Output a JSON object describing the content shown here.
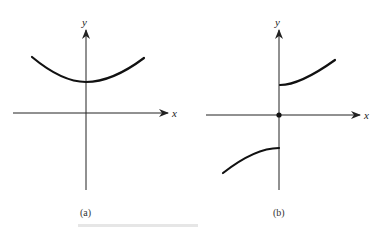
{
  "figure": {
    "panels": [
      {
        "id": "a",
        "caption": "(a)",
        "x_axis_label": "x",
        "y_axis_label": "y",
        "description": "Continuous even function, parabola-like curve with minimum on positive y-axis"
      },
      {
        "id": "b",
        "caption": "(b)",
        "x_axis_label": "x",
        "y_axis_label": "y",
        "description": "Odd function with jump discontinuity at x=0; isolated point at origin"
      }
    ]
  },
  "colors": {
    "stroke": "#111111",
    "background": "#ffffff"
  }
}
